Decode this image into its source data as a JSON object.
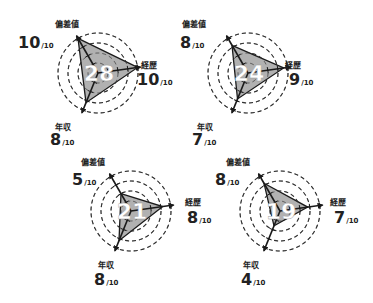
{
  "colors": {
    "fill": "#a9a9a9",
    "stroke": "#1a1a1a",
    "grid": "#333333",
    "total_text": "#ffffff"
  },
  "axes": [
    "偏差値",
    "経歴",
    "年収"
  ],
  "denominator": "/10",
  "chart_data": [
    {
      "type": "radar",
      "title": "",
      "total": "28",
      "categories": [
        "偏差値",
        "経歴",
        "年収"
      ],
      "values": [
        10,
        8,
        10
      ],
      "value_map": {
        "偏差値": 10,
        "経歴": 10,
        "年収": 8
      },
      "max": 10,
      "grid_rings": 4,
      "position": "top-left"
    },
    {
      "type": "radar",
      "title": "",
      "total": "24",
      "categories": [
        "偏差値",
        "経歴",
        "年収"
      ],
      "value_map": {
        "偏差値": 8,
        "経歴": 9,
        "年収": 7
      },
      "max": 10,
      "grid_rings": 4,
      "position": "top-right"
    },
    {
      "type": "radar",
      "title": "",
      "total": "21",
      "categories": [
        "偏差値",
        "経歴",
        "年収"
      ],
      "value_map": {
        "偏差値": 5,
        "経歴": 8,
        "年収": 8
      },
      "max": 10,
      "grid_rings": 4,
      "position": "bottom-left"
    },
    {
      "type": "radar",
      "title": "",
      "total": "19",
      "categories": [
        "偏差値",
        "経歴",
        "年収"
      ],
      "value_map": {
        "偏差値": 8,
        "経歴": 7,
        "年収": 4
      },
      "max": 10,
      "grid_rings": 4,
      "position": "bottom-right"
    }
  ],
  "charts": [
    {
      "total": "28",
      "hensachi": {
        "label": "偏差値",
        "value": "10"
      },
      "keireki": {
        "label": "経歴",
        "value": "10"
      },
      "nenshu": {
        "label": "年収",
        "value": "8"
      }
    },
    {
      "total": "24",
      "hensachi": {
        "label": "偏差値",
        "value": "8"
      },
      "keireki": {
        "label": "経歴",
        "value": "9"
      },
      "nenshu": {
        "label": "年収",
        "value": "7"
      }
    },
    {
      "total": "21",
      "hensachi": {
        "label": "偏差値",
        "value": "5"
      },
      "keireki": {
        "label": "経歴",
        "value": "8"
      },
      "nenshu": {
        "label": "年収",
        "value": "8"
      }
    },
    {
      "total": "19",
      "hensachi": {
        "label": "偏差値",
        "value": "8"
      },
      "keireki": {
        "label": "経歴",
        "value": "7"
      },
      "nenshu": {
        "label": "年収",
        "value": "4"
      }
    }
  ]
}
